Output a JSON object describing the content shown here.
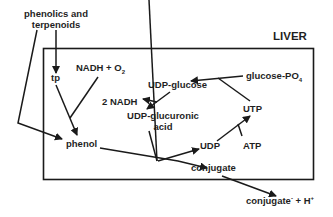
{
  "diagram": {
    "region_label": "LIVER",
    "nodes": {
      "source": {
        "line1": "phenolics and",
        "line2": "terpenoids"
      },
      "tp": "tp",
      "nadh_o2": {
        "text": "NADH + O",
        "sub": "2"
      },
      "phenol": "phenol",
      "udp_glucose": "UDP-glucose",
      "two_nadh": "2 NADH",
      "udp_glucuronic": {
        "line1": "UDP-glucuronic",
        "line2": "acid"
      },
      "glucose_po4": {
        "text": "glucose-PO",
        "sub": "4"
      },
      "utp": "UTP",
      "udp": "UDP",
      "atp": "ATP",
      "conjugate": "conjugate",
      "conjugate_out": {
        "text": "conjugate",
        "sup1": "-",
        "mid": " + H",
        "sup2": "+"
      }
    },
    "edges": [
      {
        "from": "phenolics and terpenoids",
        "to": "tp"
      },
      {
        "from": "phenolics and terpenoids",
        "to": "phenol"
      },
      {
        "from": "tp",
        "to": "phenol",
        "with": "NADH + O2"
      },
      {
        "from": "glucose-PO4",
        "to": "UDP-glucose",
        "with": "UTP"
      },
      {
        "from": "UDP-glucose",
        "to": "UDP-glucuronic acid",
        "produces": "2 NADH"
      },
      {
        "from": "phenol",
        "to": "conjugate",
        "with": "UDP-glucuronic acid",
        "produces": "UDP"
      },
      {
        "from": "UDP",
        "to": "UTP",
        "with": "ATP"
      },
      {
        "from": "conjugate",
        "to": "conjugate- + H+"
      }
    ],
    "colors": {
      "line": "#1a1a1a",
      "text": "#1f1f1f",
      "background": "#ffffff"
    }
  }
}
